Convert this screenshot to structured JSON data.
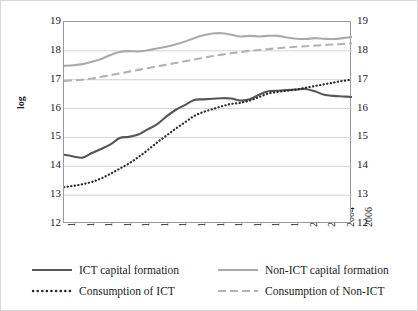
{
  "chart_data": {
    "type": "line",
    "title": "",
    "xlabel": "",
    "ylabel": "log",
    "ylim": [
      12,
      19
    ],
    "xlim": [
      1974,
      2006
    ],
    "grid": true,
    "legend_position": "bottom",
    "y_ticks": [
      "19",
      "18",
      "17",
      "16",
      "15",
      "14",
      "13",
      "12"
    ],
    "y_ticks_right": [
      "19",
      "18",
      "17",
      "16",
      "15",
      "14",
      "13",
      "12"
    ],
    "x_ticks": [
      "1974",
      "1976",
      "1978",
      "1980",
      "1982",
      "1984",
      "1986",
      "1988",
      "1990",
      "1992",
      "1994",
      "1996",
      "1998",
      "2000",
      "2002",
      "2004",
      "2006"
    ],
    "x": [
      1974,
      1975,
      1976,
      1977,
      1978,
      1979,
      1980,
      1981,
      1982,
      1983,
      1984,
      1985,
      1986,
      1987,
      1988,
      1989,
      1990,
      1991,
      1992,
      1993,
      1994,
      1995,
      1996,
      1997,
      1998,
      1999,
      2000,
      2001,
      2002,
      2003,
      2004,
      2005
    ],
    "series": [
      {
        "name": "ICT capital formation",
        "color": "#565656",
        "style": "solid",
        "values": [
          14.4,
          14.34,
          14.3,
          14.46,
          14.6,
          14.76,
          14.98,
          15.02,
          15.1,
          15.28,
          15.45,
          15.72,
          15.95,
          16.12,
          16.3,
          16.32,
          16.34,
          16.36,
          16.35,
          16.28,
          16.32,
          16.48,
          16.6,
          16.62,
          16.64,
          16.66,
          16.68,
          16.6,
          16.48,
          16.44,
          16.42,
          16.4
        ]
      },
      {
        "name": "Non-ICT capital formation",
        "color": "#aaaaaa",
        "style": "solid",
        "values": [
          17.48,
          17.5,
          17.54,
          17.62,
          17.72,
          17.86,
          17.96,
          17.99,
          17.98,
          18.02,
          18.08,
          18.14,
          18.22,
          18.32,
          18.44,
          18.54,
          18.6,
          18.61,
          18.56,
          18.5,
          18.52,
          18.5,
          18.52,
          18.52,
          18.46,
          18.42,
          18.41,
          18.44,
          18.42,
          18.41,
          18.44,
          18.48
        ]
      },
      {
        "name": "Consumption of ICT",
        "color": "#2b2b2b",
        "style": "dotted",
        "values": [
          13.28,
          13.32,
          13.38,
          13.46,
          13.58,
          13.74,
          13.92,
          14.1,
          14.32,
          14.56,
          14.82,
          15.06,
          15.3,
          15.52,
          15.74,
          15.88,
          15.98,
          16.08,
          16.16,
          16.2,
          16.28,
          16.4,
          16.52,
          16.58,
          16.62,
          16.66,
          16.72,
          16.78,
          16.84,
          16.9,
          16.96,
          17.0
        ]
      },
      {
        "name": "Consumption of Non-ICT",
        "color": "#b3b3b3",
        "style": "dashed",
        "values": [
          16.96,
          16.98,
          17.0,
          17.04,
          17.1,
          17.16,
          17.22,
          17.28,
          17.34,
          17.4,
          17.46,
          17.52,
          17.58,
          17.64,
          17.7,
          17.76,
          17.82,
          17.87,
          17.92,
          17.96,
          18.0,
          18.03,
          18.06,
          18.09,
          18.12,
          18.14,
          18.16,
          18.18,
          18.2,
          18.22,
          18.24,
          18.26
        ]
      }
    ]
  },
  "legend": {
    "items": [
      {
        "label": "ICT capital formation",
        "swatch": "solid-dark-line-icon"
      },
      {
        "label": "Non-ICT capital formation",
        "swatch": "solid-gray-line-icon"
      },
      {
        "label": "Consumption of ICT",
        "swatch": "dotted-dark-line-icon"
      },
      {
        "label": "Consumption of Non-ICT",
        "swatch": "dashed-gray-line-icon"
      }
    ]
  }
}
